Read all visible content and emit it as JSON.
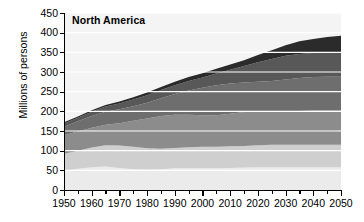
{
  "chart_data": {
    "type": "area",
    "stacked": true,
    "title": "North America",
    "xlabel": "",
    "ylabel": "Millions of persons",
    "ylim": [
      0,
      450
    ],
    "xlim": [
      1950,
      2050
    ],
    "ytick_values": [
      0,
      50,
      100,
      150,
      200,
      250,
      300,
      350,
      400,
      450
    ],
    "ytick_labels": [
      "0",
      "50",
      "100",
      "150",
      "200",
      "250",
      "300",
      "350",
      "400",
      "450"
    ],
    "xtick_values": [
      1950,
      1960,
      1970,
      1980,
      1990,
      2000,
      2010,
      2020,
      2030,
      2040,
      2050
    ],
    "xtick_labels": [
      "1950",
      "1960",
      "1970",
      "1980",
      "1990",
      "2000",
      "2010",
      "2020",
      "2030",
      "2040",
      "2050"
    ],
    "xminor_step": 5,
    "grid": "horizontal-white",
    "legend": "none",
    "x": [
      1950,
      1955,
      1960,
      1965,
      1970,
      1975,
      1980,
      1985,
      1990,
      1995,
      2000,
      2005,
      2010,
      2015,
      2020,
      2025,
      2030,
      2035,
      2040,
      2045,
      2050
    ],
    "series": [
      {
        "name": "band-1",
        "color": "#ebebeb",
        "values": [
          48,
          54,
          58,
          60,
          56,
          53,
          52,
          53,
          55,
          55,
          55,
          55,
          56,
          57,
          58,
          58,
          58,
          58,
          58,
          58,
          58
        ]
      },
      {
        "name": "band-2",
        "color": "#cfcfcf",
        "values": [
          44,
          46,
          50,
          54,
          57,
          57,
          54,
          52,
          52,
          54,
          55,
          55,
          55,
          55,
          56,
          57,
          57,
          57,
          57,
          57,
          57
        ]
      },
      {
        "name": "band-3",
        "color": "#8c8c8c",
        "values": [
          47,
          49,
          50,
          52,
          57,
          66,
          76,
          83,
          84,
          82,
          80,
          80,
          83,
          86,
          87,
          86,
          86,
          86,
          87,
          88,
          88
        ]
      },
      {
        "name": "band-4",
        "color": "#6e6e6e",
        "values": [
          22,
          26,
          30,
          33,
          35,
          37,
          40,
          45,
          53,
          62,
          70,
          76,
          77,
          75,
          74,
          76,
          80,
          84,
          85,
          85,
          85
        ]
      },
      {
        "name": "band-5",
        "color": "#585858",
        "values": [
          8,
          9,
          11,
          13,
          15,
          17,
          19,
          21,
          22,
          24,
          26,
          30,
          35,
          42,
          50,
          56,
          60,
          61,
          61,
          62,
          63
        ]
      },
      {
        "name": "band-6",
        "color": "#2b2b2b",
        "values": [
          3,
          3,
          4,
          4,
          5,
          6,
          7,
          8,
          9,
          10,
          11,
          12,
          13,
          15,
          18,
          22,
          27,
          32,
          36,
          39,
          41
        ]
      }
    ],
    "totals": [
      172,
      187,
      203,
      216,
      225,
      236,
      248,
      262,
      275,
      287,
      297,
      308,
      319,
      330,
      343,
      355,
      368,
      378,
      384,
      389,
      392
    ]
  }
}
